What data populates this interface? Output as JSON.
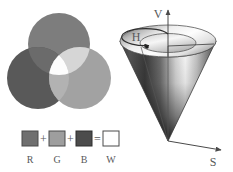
{
  "figure": {
    "background_color": "#ffffff"
  },
  "venn": {
    "name": "additive-color-venn",
    "circles": [
      {
        "id": "red",
        "label": "R",
        "cx": 59,
        "cy": 44,
        "r": 31,
        "color": "#7d7d7d"
      },
      {
        "id": "green",
        "label": "G",
        "cx": 38,
        "cy": 78,
        "r": 31,
        "color": "#595959"
      },
      {
        "id": "blue",
        "label": "B",
        "cx": 80,
        "cy": 78,
        "r": 31,
        "color": "#a2a2a2"
      }
    ],
    "overlaps": {
      "red_green": "#6a6a6a",
      "red_blue": "#d4d4d4",
      "green_blue": "#b4b4b4",
      "center": "#ffffff"
    }
  },
  "legend": {
    "name": "rgb-sum-legend",
    "plus_symbol": "+",
    "equals_symbol": "=",
    "swatches": [
      {
        "label": "R",
        "color": "#6f6f6f",
        "border": "#4a4a4a"
      },
      {
        "label": "G",
        "color": "#9e9e9e",
        "border": "#4a4a4a"
      },
      {
        "label": "B",
        "color": "#4c4c4c",
        "border": "#2e2e2e"
      },
      {
        "label": "W",
        "color": "#ffffff",
        "border": "#4a4a4a"
      }
    ]
  },
  "cone": {
    "name": "hsv-color-cone",
    "axes": [
      {
        "id": "value",
        "label": "V",
        "description": "vertical value axis"
      },
      {
        "id": "saturation",
        "label": "S",
        "description": "radial saturation axis"
      }
    ],
    "hue": {
      "label": "H",
      "description": "circular hue arrow on top disc"
    },
    "colors": {
      "cone_light": "#ffffff",
      "cone_mid": "#9a9a9a",
      "cone_dark": "#2b2b2b",
      "top_disc_light": "#f2f2f2",
      "top_disc_dark": "#7b7b7b",
      "outline": "#4a4a4a"
    }
  }
}
